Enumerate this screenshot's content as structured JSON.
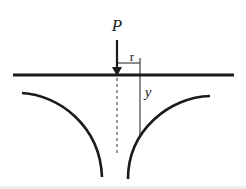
{
  "diagram": {
    "labels": {
      "load": "P",
      "radius": "r",
      "depth": "y"
    },
    "colors": {
      "stroke": "#1a1a1a",
      "background": "#ffffff",
      "dashed_axis": "#555555"
    }
  }
}
